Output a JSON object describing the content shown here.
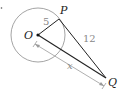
{
  "diagram": {
    "points": {
      "O": {
        "label": "O",
        "x": 38,
        "y": 35
      },
      "P": {
        "label": "P",
        "x": 59,
        "y": 19
      },
      "Q": {
        "label": "Q",
        "x": 106,
        "y": 78
      }
    },
    "circle": {
      "cx": 38,
      "cy": 35,
      "r": 27,
      "color": "#9a9a9a"
    },
    "segments": [
      {
        "from": "O",
        "to": "P",
        "label": "5"
      },
      {
        "from": "P",
        "to": "Q",
        "label": "12"
      },
      {
        "from": "O",
        "to": "Q",
        "label": "x"
      }
    ],
    "labels": {
      "radius": "5",
      "tangent": "12",
      "distance": "x",
      "O": "O",
      "P": "P",
      "Q": "Q"
    },
    "colors": {
      "line": "#222222",
      "dimension": "#9a9a9a",
      "number": "#888888"
    }
  }
}
